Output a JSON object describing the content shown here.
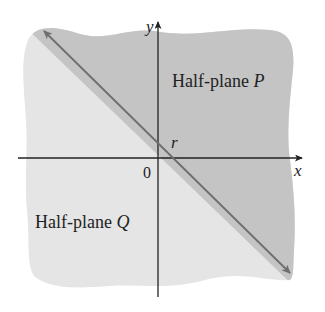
{
  "figure": {
    "axes": {
      "x_label": "x",
      "y_label": "y",
      "origin_label": "0"
    },
    "line": {
      "intercept_label": "r"
    },
    "regions": [
      {
        "id": "P",
        "label_prefix": "Half-plane ",
        "label_var": "P",
        "fill": "#c4c4c4"
      },
      {
        "id": "Q",
        "label_prefix": "Half-plane ",
        "label_var": "Q",
        "fill": "#e5e5e5"
      }
    ],
    "colors": {
      "axis": "#222222",
      "boundary_line": "#6e6e6e",
      "background": "#ffffff"
    }
  }
}
